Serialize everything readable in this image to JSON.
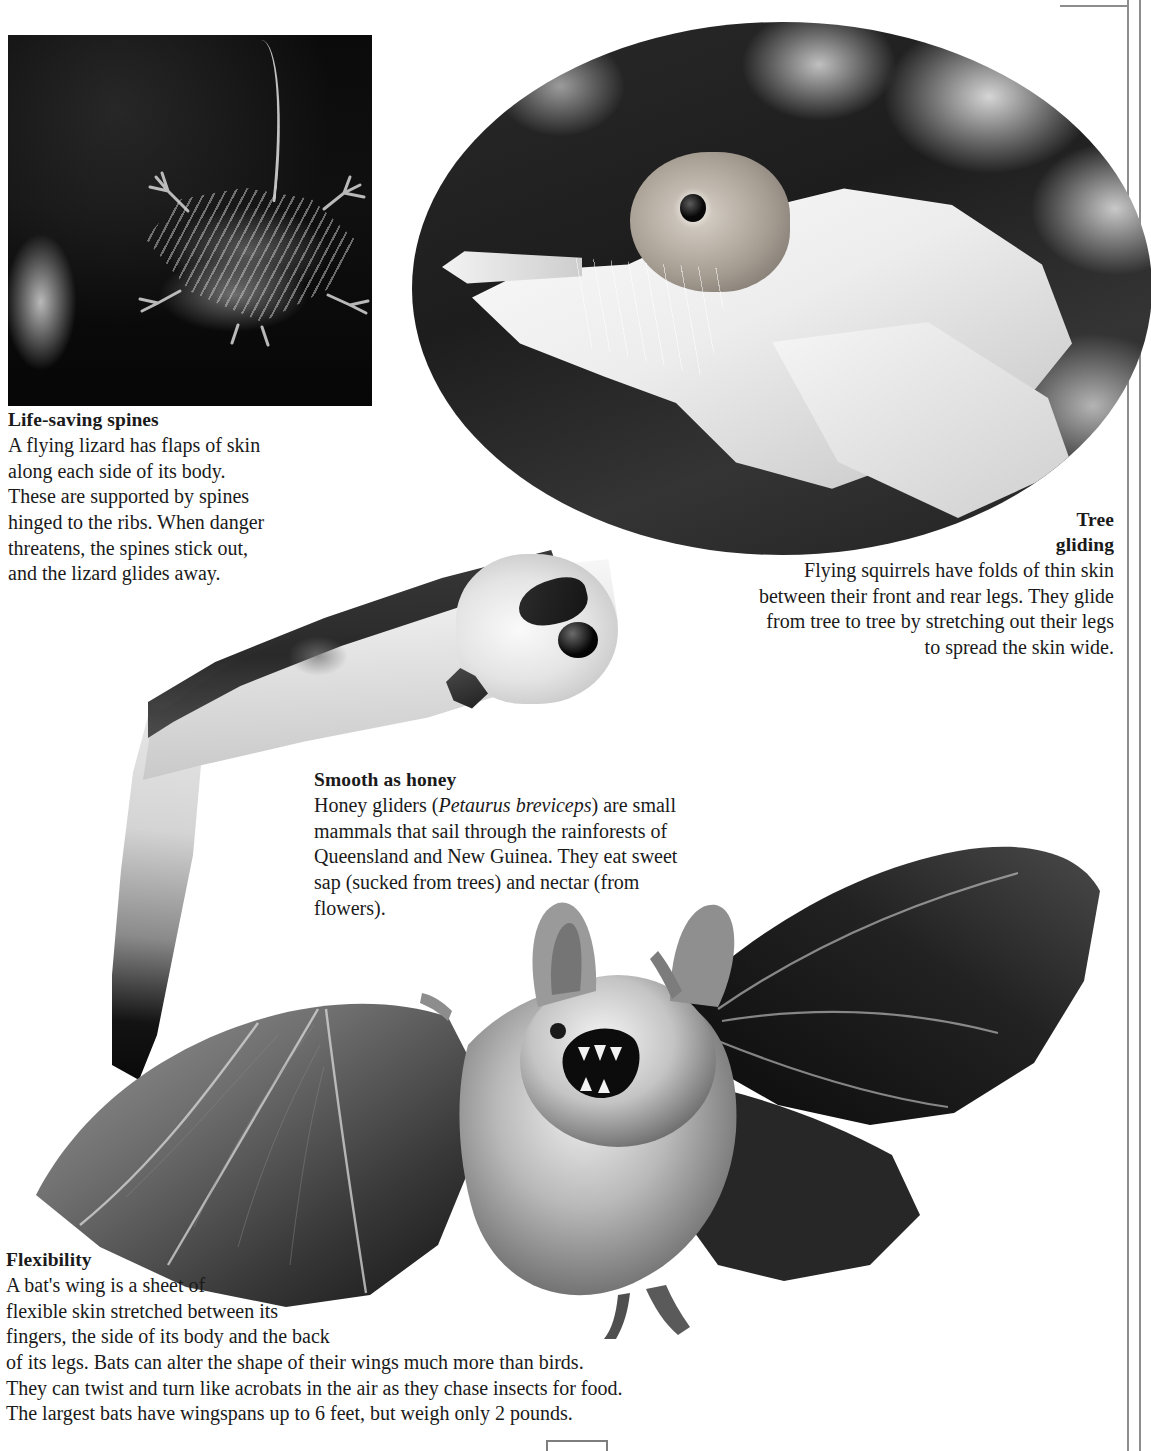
{
  "page": {
    "background_color": "#ffffff",
    "text_color": "#1a1a1a",
    "rule_color": "#8d8d8d",
    "page_number": ""
  },
  "photos": [
    {
      "name": "flying-lizard-photo",
      "subject": "flying lizard perched on a branch at night",
      "shape": "rectangle",
      "tone": "black and white"
    },
    {
      "name": "flying-squirrel-photo",
      "subject": "flying squirrel gliding with skin folds spread, against blurred foliage",
      "shape": "oval",
      "tone": "black and white"
    },
    {
      "name": "honey-glider-photo",
      "subject": "honey glider (sugar glider) with dark dorsal stripe and long tail",
      "shape": "cut-out",
      "tone": "black and white"
    },
    {
      "name": "bat-photo",
      "subject": "bat in flight with wings fully outstretched, mouth open",
      "shape": "cut-out",
      "tone": "black and white"
    }
  ],
  "captions": {
    "lizard": {
      "heading": "Life-saving spines",
      "body": "A flying lizard has flaps of skin along each side of its body. These are supported by spines hinged to the ribs. When danger threatens, the spines stick out, and the lizard glides away."
    },
    "tree": {
      "heading_line_1": "Tree",
      "heading_line_2": "gliding",
      "body": "Flying squirrels have folds of thin skin between their front and rear legs. They glide from tree to tree by stretching out their legs to spread the skin wide."
    },
    "honey": {
      "heading": "Smooth as honey",
      "body_before_species": "Honey gliders (",
      "species": "Petaurus breviceps",
      "body_after_species": ") are small mammals that sail through the rainforests of Queensland and New Guinea. They eat sweet sap (sucked from trees) and nectar (from flowers)."
    },
    "flexibility": {
      "heading": "Flexibility",
      "body": "A bat's wing is a sheet of\nflexible skin stretched between its\nfingers, the side of its body and the back\nof its legs. Bats can alter the shape of their wings much more than birds.\nThey can twist and turn like acrobats in the air as they chase insects for food.\nThe largest bats have wingspans up to 6 feet, but weigh only 2 pounds."
    }
  }
}
